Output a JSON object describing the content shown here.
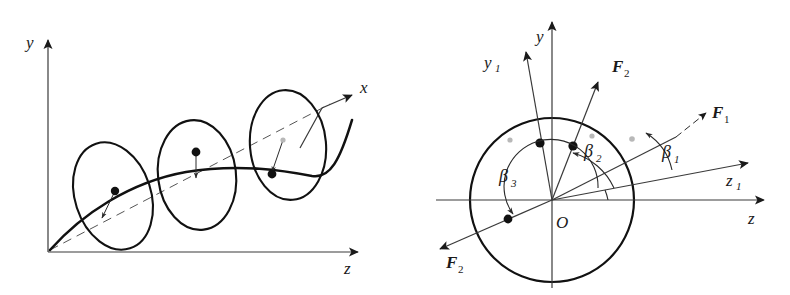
{
  "figure": {
    "width": 790,
    "height": 295,
    "background": "#ffffff",
    "ink": "#1a1a1a"
  },
  "left_diagram": {
    "name": "perspective-shaft-view",
    "axes": [
      {
        "id": "y",
        "label": "y",
        "sub": "",
        "direction": "up"
      },
      {
        "id": "z",
        "label": "z",
        "sub": "",
        "direction": "right"
      },
      {
        "id": "x",
        "label": "x",
        "sub": "",
        "direction": "diagonal-up-right"
      }
    ],
    "disks": [
      {
        "id": "disk-1",
        "label": "",
        "has_center_dot": true,
        "has_radius_line": true
      },
      {
        "id": "disk-2",
        "label": "",
        "has_center_dot": true,
        "has_radius_line": true
      },
      {
        "id": "disk-3",
        "label": "",
        "has_center_dot": true,
        "has_radius_line": true
      }
    ],
    "shaft": {
      "id": "shaft-curve",
      "style": "bowed-curve"
    },
    "centerline": {
      "id": "x-centerline",
      "style": "dashed"
    }
  },
  "right_diagram": {
    "name": "front-force-view",
    "origin_label": "O",
    "axes": [
      {
        "id": "y",
        "label": "y",
        "sub": ""
      },
      {
        "id": "z",
        "label": "z",
        "sub": ""
      },
      {
        "id": "y1",
        "label": "y",
        "sub": "1"
      },
      {
        "id": "z1",
        "label": "z",
        "sub": "1"
      }
    ],
    "vectors": [
      {
        "id": "F1",
        "label": "F",
        "sub": "1",
        "direction": "upper-right-shallow"
      },
      {
        "id": "F2-upper",
        "label": "F",
        "sub": "2",
        "direction": "upper-right-steep"
      },
      {
        "id": "F2-lower",
        "label": "F",
        "sub": "2",
        "direction": "lower-left"
      }
    ],
    "angles": [
      {
        "id": "beta1",
        "label": "β",
        "sub": "1",
        "between": "z1-axis and F1"
      },
      {
        "id": "beta2",
        "label": "β",
        "sub": "2",
        "between": "z1-axis and F2-upper"
      },
      {
        "id": "beta3",
        "label": "β",
        "sub": "3",
        "between": "z1-axis and F2-lower"
      }
    ],
    "circle": {
      "id": "rotor-circle"
    }
  }
}
